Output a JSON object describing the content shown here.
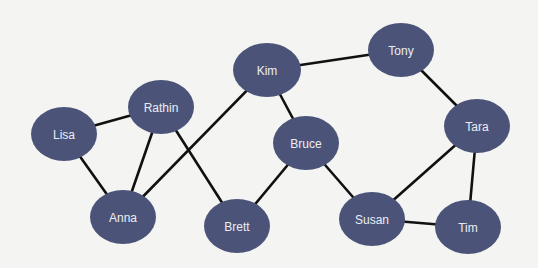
{
  "diagram": {
    "type": "social-network-graph",
    "colors": {
      "background": "#f4f4f2",
      "node_fill": "#4b5478",
      "node_label": "#ecedf2",
      "edge": "#111111"
    },
    "nodes": [
      {
        "id": "lisa",
        "label": "Lisa",
        "cx": 64,
        "cy": 134,
        "rx": 33,
        "ry": 27
      },
      {
        "id": "rathin",
        "label": "Rathin",
        "cx": 161,
        "cy": 107,
        "rx": 33,
        "ry": 27
      },
      {
        "id": "kim",
        "label": "Kim",
        "cx": 267,
        "cy": 70,
        "rx": 34,
        "ry": 27
      },
      {
        "id": "tony",
        "label": "Tony",
        "cx": 401,
        "cy": 50,
        "rx": 33,
        "ry": 27
      },
      {
        "id": "tara",
        "label": "Tara",
        "cx": 477,
        "cy": 126,
        "rx": 33,
        "ry": 27
      },
      {
        "id": "bruce",
        "label": "Bruce",
        "cx": 306,
        "cy": 143,
        "rx": 33,
        "ry": 27
      },
      {
        "id": "anna",
        "label": "Anna",
        "cx": 123,
        "cy": 217,
        "rx": 33,
        "ry": 27
      },
      {
        "id": "brett",
        "label": "Brett",
        "cx": 237,
        "cy": 226,
        "rx": 33,
        "ry": 27
      },
      {
        "id": "susan",
        "label": "Susan",
        "cx": 372,
        "cy": 219,
        "rx": 33,
        "ry": 27
      },
      {
        "id": "tim",
        "label": "Tim",
        "cx": 468,
        "cy": 227,
        "rx": 33,
        "ry": 27
      }
    ],
    "edges": [
      {
        "from": "lisa",
        "to": "rathin"
      },
      {
        "from": "lisa",
        "to": "anna"
      },
      {
        "from": "rathin",
        "to": "anna"
      },
      {
        "from": "rathin",
        "to": "brett"
      },
      {
        "from": "anna",
        "to": "kim"
      },
      {
        "from": "kim",
        "to": "tony"
      },
      {
        "from": "kim",
        "to": "bruce"
      },
      {
        "from": "bruce",
        "to": "brett"
      },
      {
        "from": "bruce",
        "to": "susan"
      },
      {
        "from": "tony",
        "to": "tara"
      },
      {
        "from": "tara",
        "to": "susan"
      },
      {
        "from": "tara",
        "to": "tim"
      },
      {
        "from": "susan",
        "to": "tim"
      }
    ]
  }
}
